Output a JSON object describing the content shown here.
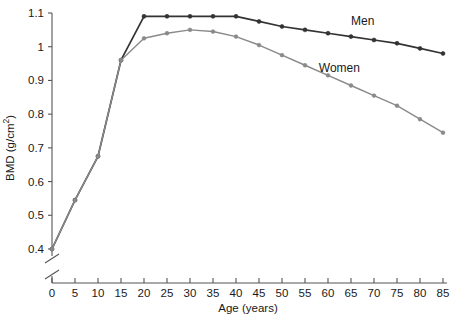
{
  "chart_data": {
    "type": "line",
    "title": "",
    "xlabel": "Age (years)",
    "ylabel": "BMD (g/cm2)",
    "ylabel_display": "BMD (g/cm²)",
    "xlim": [
      0,
      85
    ],
    "ylim": [
      0.4,
      1.1
    ],
    "grid": false,
    "legend_position": "inline-annotation",
    "y_axis_break": true,
    "y_axis_break_note": "axis broken between 0 and 0.4",
    "x_ticks": [
      0,
      5,
      10,
      15,
      20,
      25,
      30,
      35,
      40,
      45,
      50,
      55,
      60,
      65,
      70,
      75,
      80,
      85
    ],
    "x_tick_labels": [
      "0",
      "5",
      "10",
      "15",
      "20",
      "25",
      "30",
      "35",
      "40",
      "45",
      "50",
      "55",
      "60",
      "65",
      "70",
      "75",
      "80",
      "85"
    ],
    "y_ticks": [
      0.4,
      0.5,
      0.6,
      0.7,
      0.8,
      0.9,
      1.0,
      1.1
    ],
    "y_tick_labels": [
      "0.4",
      "0.5",
      "0.6",
      "0.7",
      "0.8",
      "0.9",
      "1",
      "1.1"
    ],
    "x": [
      0,
      5,
      10,
      15,
      20,
      25,
      30,
      35,
      40,
      45,
      50,
      55,
      60,
      65,
      70,
      75,
      80,
      85
    ],
    "series": [
      {
        "name": "Men",
        "color": "#333333",
        "marker": "circle",
        "label_x": 65,
        "label_y": 1.065,
        "values": [
          0.4,
          0.545,
          0.675,
          0.96,
          1.09,
          1.09,
          1.09,
          1.09,
          1.09,
          1.075,
          1.06,
          1.05,
          1.04,
          1.03,
          1.02,
          1.01,
          0.995,
          0.98
        ]
      },
      {
        "name": "Women",
        "color": "#8a8a8a",
        "marker": "circle",
        "label_x": 58,
        "label_y": 0.925,
        "values": [
          0.4,
          0.545,
          0.675,
          0.96,
          1.025,
          1.04,
          1.05,
          1.045,
          1.03,
          1.005,
          0.975,
          0.945,
          0.915,
          0.885,
          0.855,
          0.825,
          0.785,
          0.745
        ]
      }
    ]
  }
}
